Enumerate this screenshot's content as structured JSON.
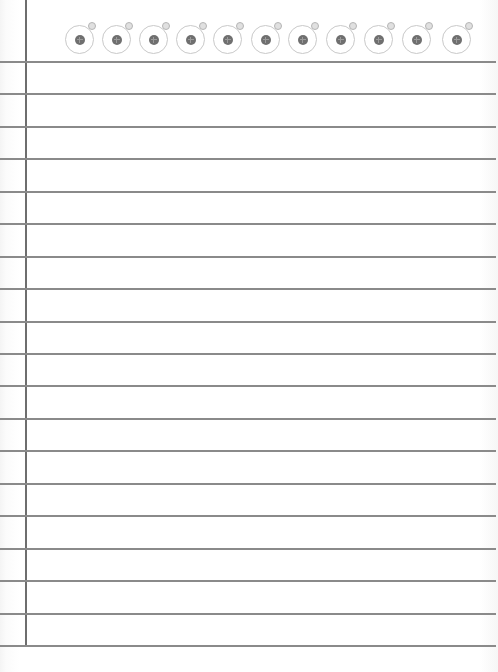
{
  "notepad": {
    "background_color": "#ffffff",
    "rule_color": "#8a8a8a",
    "margin_color": "#6e6e6e",
    "ring_count": 11,
    "ring_centers_x": [
      80,
      117,
      154,
      191,
      228,
      266,
      303,
      341,
      379,
      417,
      457
    ],
    "ring_center_y": 40,
    "margin_line_x": 25,
    "rule_count": 19,
    "rule_positions_y": [
      61,
      93,
      126,
      158,
      191,
      223,
      256,
      288,
      321,
      353,
      385,
      418,
      450,
      483,
      515,
      548,
      580,
      613,
      645
    ],
    "lines_text": [
      "",
      "",
      "",
      "",
      "",
      "",
      "",
      "",
      "",
      "",
      "",
      "",
      "",
      "",
      "",
      "",
      "",
      "",
      ""
    ]
  }
}
